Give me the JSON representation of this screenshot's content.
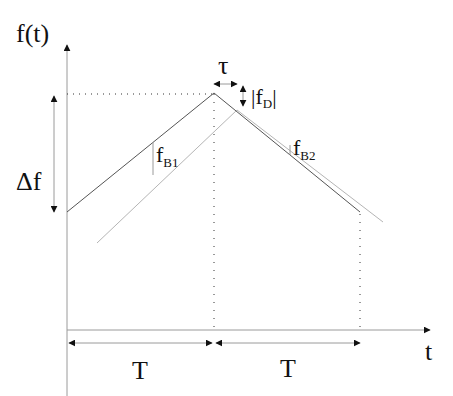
{
  "diagram": {
    "labels": {
      "y_axis": "f(t)",
      "x_axis": "t",
      "delta_f": "Δf",
      "tau": "τ",
      "doppler": "|f",
      "doppler_sub": "D",
      "doppler_close": "|",
      "beat1": "f",
      "beat1_sub": "B1",
      "beat2": "f",
      "beat2_sub": "B2",
      "period_left": "T",
      "period_right": "T"
    },
    "colors": {
      "transmitted": "#555555",
      "received": "#b5b5b5",
      "axis": "#9a9a9a",
      "arrow": "#111111",
      "dotted": "#333333"
    },
    "series": [
      {
        "name": "transmitted",
        "points": [
          [
            67,
            212
          ],
          [
            214,
            93
          ],
          [
            360,
            212
          ]
        ]
      },
      {
        "name": "received",
        "points": [
          [
            97,
            243
          ],
          [
            237,
            110
          ],
          [
            383,
            222
          ]
        ]
      }
    ]
  }
}
